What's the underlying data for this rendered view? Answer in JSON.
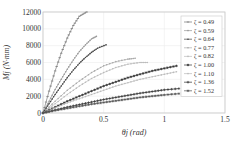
{
  "chart_data": {
    "type": "line",
    "title": "",
    "xlabel": "θj (rad)",
    "ylabel": "Mj (N·mm)",
    "xlim": [
      0,
      1.5
    ],
    "ylim": [
      0,
      12000
    ],
    "xticks": [
      "0",
      "0.5",
      "1",
      "1.5"
    ],
    "yticks": [
      "0",
      "2000",
      "4000",
      "6000",
      "8000",
      "10000",
      "12000"
    ],
    "grid": true,
    "legend_position": "right",
    "series": [
      {
        "name": "ζ = 0.49",
        "label": "ζ = 0.49",
        "color": "#777777",
        "marker": "dash",
        "x": [
          0,
          0.05,
          0.1,
          0.15,
          0.2,
          0.25,
          0.3,
          0.36
        ],
        "y": [
          0,
          2600,
          5000,
          7100,
          8900,
          10400,
          11500,
          12000
        ]
      },
      {
        "name": "ζ = 0.59",
        "label": "ζ = 0.59",
        "color": "#999999",
        "marker": "dot",
        "x": [
          0,
          0.05,
          0.1,
          0.15,
          0.2,
          0.25,
          0.3,
          0.35,
          0.4,
          0.44
        ],
        "y": [
          0,
          1400,
          2800,
          4000,
          5200,
          6300,
          7300,
          8100,
          8800,
          9100
        ]
      },
      {
        "name": "ζ = 0.64",
        "label": "ζ = 0.64",
        "color": "#444444",
        "marker": "dot",
        "x": [
          0,
          0.05,
          0.1,
          0.15,
          0.2,
          0.25,
          0.3,
          0.35,
          0.4,
          0.45,
          0.52
        ],
        "y": [
          0,
          1100,
          2200,
          3200,
          4200,
          5100,
          5900,
          6600,
          7200,
          7700,
          8100
        ]
      },
      {
        "name": "ζ = 0.77",
        "label": "ζ = 0.77",
        "color": "#aaaaaa",
        "marker": "dot",
        "x": [
          0,
          0.1,
          0.2,
          0.3,
          0.4,
          0.5,
          0.6,
          0.7,
          0.76
        ],
        "y": [
          0,
          1400,
          2700,
          3800,
          4800,
          5600,
          6100,
          6400,
          6500
        ]
      },
      {
        "name": "ζ = 0.82",
        "label": "ζ = 0.82",
        "color": "#bbbbbb",
        "marker": "dot",
        "x": [
          0,
          0.1,
          0.2,
          0.3,
          0.4,
          0.5,
          0.6,
          0.7,
          0.8,
          0.86
        ],
        "y": [
          0,
          1100,
          2200,
          3200,
          4100,
          4800,
          5400,
          5800,
          6000,
          6000
        ]
      },
      {
        "name": "ζ = 1.00",
        "label": "ζ = 1.00",
        "color": "#333333",
        "marker": "star",
        "x": [
          0,
          0.1,
          0.2,
          0.3,
          0.4,
          0.5,
          0.6,
          0.7,
          0.8,
          0.9,
          1.0,
          1.1
        ],
        "y": [
          0,
          700,
          1400,
          2000,
          2600,
          3200,
          3700,
          4200,
          4600,
          5000,
          5300,
          5600
        ]
      },
      {
        "name": "ζ = 1.10",
        "label": "ζ = 1.10",
        "color": "#bbbbbb",
        "marker": "dot",
        "x": [
          0,
          0.1,
          0.2,
          0.3,
          0.4,
          0.5,
          0.6,
          0.7,
          0.8,
          0.9,
          1.0,
          1.1
        ],
        "y": [
          0,
          600,
          1200,
          1700,
          2200,
          2700,
          3200,
          3600,
          4000,
          4300,
          4600,
          4900
        ]
      },
      {
        "name": "ζ = 1.36",
        "label": "ζ = 1.36",
        "color": "#333333",
        "marker": "plus",
        "x": [
          0,
          0.1,
          0.2,
          0.3,
          0.4,
          0.5,
          0.6,
          0.7,
          0.8,
          0.9,
          1.0,
          1.12
        ],
        "y": [
          0,
          350,
          700,
          1000,
          1300,
          1600,
          1850,
          2100,
          2350,
          2550,
          2750,
          2900
        ]
      },
      {
        "name": "ζ = 1.52",
        "label": "ζ = 1.52",
        "color": "#555555",
        "marker": "star",
        "x": [
          0,
          0.1,
          0.2,
          0.3,
          0.4,
          0.5,
          0.6,
          0.7,
          0.8,
          0.9,
          1.0,
          1.12
        ],
        "y": [
          0,
          300,
          550,
          800,
          1050,
          1250,
          1450,
          1650,
          1850,
          2000,
          2150,
          2300
        ]
      }
    ]
  }
}
